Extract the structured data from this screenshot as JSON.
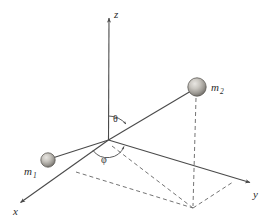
{
  "figure": {
    "background_color": "#ffffff",
    "line_color": "#4a4a4a",
    "dash_color": "#6b6b6b",
    "text_color": "#2b2b2b"
  },
  "axes": [
    {
      "id": "z",
      "label": "z",
      "sublabel": "",
      "direction": "up"
    },
    {
      "id": "y",
      "label": "y",
      "sublabel": "",
      "direction": "right-down"
    },
    {
      "id": "x",
      "label": "x",
      "sublabel": "",
      "direction": "left-down"
    }
  ],
  "angles": [
    {
      "id": "theta",
      "label": "θ",
      "description": "polar angle from z-axis to mass 2 radius vector"
    },
    {
      "id": "phi",
      "label": "φ",
      "description": "azimuthal angle in the xy-plane"
    }
  ],
  "masses": [
    {
      "id": "m1",
      "label": "m",
      "sublabel": "1",
      "shading": "sphere-gray",
      "radius": 7
    },
    {
      "id": "m2",
      "label": "m",
      "sublabel": "2",
      "shading": "sphere-gray",
      "radius": 9
    }
  ],
  "geometry": {
    "origin": {
      "x": 108,
      "y": 140
    },
    "z_axis_tip": {
      "x": 109,
      "y": 14
    },
    "y_axis_tip": {
      "x": 254,
      "y": 185
    },
    "x_axis_tip": {
      "x": 17,
      "y": 205
    },
    "m1_center": {
      "x": 48,
      "y": 160
    },
    "m2_center": {
      "x": 197,
      "y": 87
    },
    "m2_projection": {
      "x": 193,
      "y": 208
    }
  },
  "elements": {
    "z_axis_name": "z-axis",
    "y_axis_name": "y-axis",
    "x_axis_name": "x-axis",
    "radius_vector_m1": "origin-to-m1 line",
    "radius_vector_m2": "origin-to-m2 line",
    "projection_dashed": "m2 vertical projection",
    "plane_dashed": "xy-plane projection parallelogram"
  }
}
